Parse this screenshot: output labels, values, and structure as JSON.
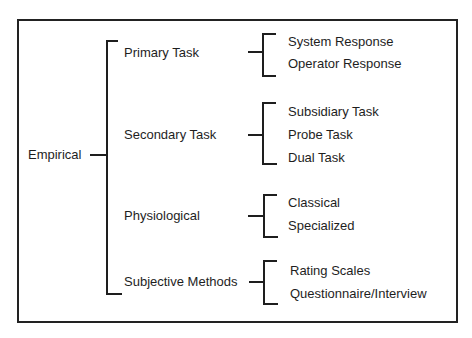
{
  "diagram": {
    "root": {
      "label": "Empirical"
    },
    "categories": [
      {
        "label": "Primary Task",
        "children": [
          "System Response",
          "Operator Response"
        ]
      },
      {
        "label": "Secondary Task",
        "children": [
          "Subsidiary Task",
          "Probe Task",
          "Dual Task"
        ]
      },
      {
        "label": "Physiological",
        "children": [
          "Classical",
          "Specialized"
        ]
      },
      {
        "label": "Subjective Methods",
        "children": [
          "Rating Scales",
          "Questionnaire/Interview"
        ]
      }
    ]
  }
}
